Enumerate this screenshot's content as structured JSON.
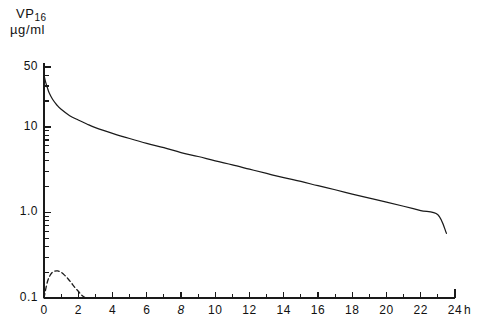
{
  "chart_data": {
    "type": "line",
    "title": "VP16",
    "title_main": "VP",
    "title_sub": "16",
    "ylabel": "µg/ml",
    "xlabel": "h",
    "xlabel_unit": "h",
    "yscale": "log",
    "xscale": "linear",
    "xlim": [
      0,
      24
    ],
    "ylim": [
      0.1,
      50
    ],
    "grid": false,
    "legend": "none",
    "y_major_ticks": [
      50,
      10,
      1.0,
      0.1
    ],
    "y_major_tick_labels": [
      "50",
      "10",
      "1.0",
      "0.1"
    ],
    "y_minor_ticks": [
      20,
      30,
      40,
      2,
      3,
      4,
      5,
      6,
      7,
      8,
      9,
      0.2,
      0.3,
      0.4,
      0.5,
      0.6,
      0.7,
      0.8,
      0.9
    ],
    "x_major_ticks": [
      0,
      2,
      4,
      6,
      8,
      10,
      12,
      14,
      16,
      18,
      20,
      22,
      24
    ],
    "x_major_tick_labels": [
      "0",
      "2",
      "4",
      "6",
      "8",
      "10",
      "12",
      "14",
      "16",
      "18",
      "20",
      "22",
      "24"
    ],
    "x_minor_ticks": [
      1,
      3,
      5,
      7,
      9,
      11,
      13,
      15,
      17,
      19,
      21,
      23
    ],
    "series": [
      {
        "name": "plasma-concentration",
        "style": "solid",
        "x": [
          0.0,
          0.1,
          0.2,
          0.3,
          0.5,
          0.75,
          1.0,
          1.5,
          2.0,
          2.5,
          3.0,
          4.0,
          5.0,
          6.0,
          7.0,
          8.0,
          9.0,
          10.0,
          11.0,
          12.0,
          13.0,
          14.0,
          15.0,
          16.0,
          17.0,
          18.0,
          19.0,
          20.0,
          21.0,
          22.0,
          23.0,
          23.5
        ],
        "y": [
          40.0,
          33.0,
          28.5,
          25.0,
          21.0,
          18.0,
          16.0,
          13.5,
          12.0,
          10.8,
          9.8,
          8.4,
          7.3,
          6.4,
          5.7,
          5.0,
          4.5,
          4.0,
          3.6,
          3.2,
          2.85,
          2.55,
          2.3,
          2.05,
          1.84,
          1.64,
          1.47,
          1.32,
          1.18,
          1.05,
          0.94,
          0.57
        ]
      },
      {
        "name": "metabolite-concentration",
        "style": "dashed",
        "x": [
          0.0,
          0.2,
          0.4,
          0.6,
          0.8,
          1.0,
          1.2,
          1.4,
          1.6,
          1.8,
          2.0,
          2.2,
          2.4,
          2.5
        ],
        "y": [
          0.1,
          0.155,
          0.19,
          0.205,
          0.207,
          0.2,
          0.185,
          0.168,
          0.15,
          0.133,
          0.12,
          0.108,
          0.101,
          0.1
        ]
      }
    ],
    "colors": {
      "axis": "#1a1a1a",
      "curve_solid": "#1a1a1a",
      "curve_dashed": "#1a1a1a",
      "background": "#ffffff"
    }
  }
}
